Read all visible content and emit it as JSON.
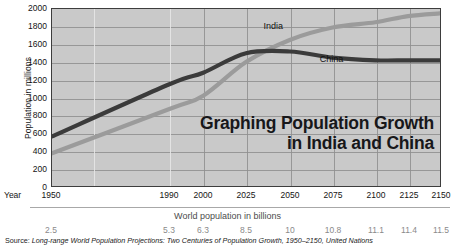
{
  "chart_data": {
    "type": "line",
    "title": "Graphing Population Growth in India and China",
    "title_line1": "Graphing Population Growth",
    "title_line2": "in India and China",
    "ylabel": "Population in millions",
    "xlabel": "Year",
    "ylim": [
      0,
      2000
    ],
    "ytick_step": 200,
    "yticks": [
      "2000",
      "1800",
      "1600",
      "1400",
      "1200",
      "1000",
      "800",
      "600",
      "400",
      "200",
      "0"
    ],
    "ytick_values": [
      2000,
      1800,
      1600,
      1400,
      1200,
      1000,
      800,
      600,
      400,
      200,
      0
    ],
    "categories": [
      "1950",
      "1990",
      "2000",
      "2025",
      "2050",
      "2075",
      "2100",
      "2125",
      "2150"
    ],
    "x_values": [
      1950,
      1990,
      2000,
      2025,
      2050,
      2075,
      2100,
      2125,
      2150
    ],
    "x_positions_px": [
      0.0,
      0.3026,
      0.3897,
      0.5,
      0.6128,
      0.7231,
      0.8333,
      0.9179,
      1.0
    ],
    "grid": true,
    "legend": "inline-labels",
    "legend_position": "inline",
    "series": [
      {
        "name": "China",
        "color": "#3b3b3b",
        "values": [
          560,
          1150,
          1280,
          1500,
          1520,
          1450,
          1420,
          1420,
          1420
        ],
        "label_x_pct": 69.0,
        "label_y_pct": 25.5
      },
      {
        "name": "India",
        "color": "#9b9b9b",
        "values": [
          370,
          870,
          1020,
          1400,
          1650,
          1790,
          1850,
          1920,
          1950
        ],
        "label_x_pct": 54.5,
        "label_y_pct": 6.5
      }
    ],
    "secondary_axis": {
      "title": "World population in billions",
      "ticks": [
        "2.5",
        "5.3",
        "6.3",
        "8.5",
        "10",
        "10.8",
        "11.1",
        "11.4",
        "11.5"
      ],
      "values": [
        2.5,
        5.3,
        6.3,
        8.5,
        10,
        10.8,
        11.1,
        11.4,
        11.5
      ]
    },
    "source": "Source: Long-range World Population Projections: Two Centuries of Population Growth, 1950–2150, United Nations",
    "source_prefix": "Source: ",
    "source_italic": "Long-range World Population Projections: Two Centuries of Population Growth, 1950–2150, United Nations",
    "colors": {
      "plot_background": "#c9c9c9",
      "grid": "#8e8e8e",
      "frame": "#3d3d3d",
      "china": "#3b3b3b",
      "india": "#9b9b9b",
      "secondary_text": "#8a8a8a",
      "world_pop_title": "#4c4c4c"
    }
  }
}
